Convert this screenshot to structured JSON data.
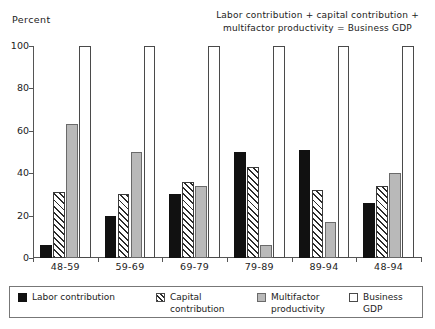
{
  "ylabel": "Percent",
  "annotation": "Labor contribution + capital contribution + multifactor productivity = Business GDP",
  "legend": {
    "items": [
      {
        "name": "labor",
        "label": "Labor contribution",
        "color": "#111111"
      },
      {
        "name": "capital",
        "label": "Capital\ncontribution",
        "color": "#2b2b2b"
      },
      {
        "name": "multifactor",
        "label": "Multifactor\nproductivity",
        "color": "#b9b9b9"
      },
      {
        "name": "gdp",
        "label": "Business GDP",
        "color": "#ffffff"
      }
    ]
  },
  "chart_data": {
    "type": "bar",
    "title": "",
    "subtitle": "",
    "annotation": "Labor contribution + capital contribution + multifactor productivity = Business GDP",
    "xlabel": "",
    "ylabel": "Percent",
    "ylim": [
      0,
      100
    ],
    "yticks": [
      0,
      20,
      40,
      60,
      80,
      100
    ],
    "ytick_labels": [
      "0",
      "20",
      "40",
      "60",
      "80",
      "100"
    ],
    "grid": false,
    "legend_position": "bottom",
    "categories": [
      "48-59",
      "59-69",
      "69-79",
      "79-89",
      "89-94",
      "48-94"
    ],
    "series": [
      {
        "name": "Labor contribution",
        "key": "labor",
        "values": [
          6,
          20,
          30,
          50,
          51,
          26
        ]
      },
      {
        "name": "Capital contribution",
        "key": "capital",
        "values": [
          31,
          30,
          36,
          43,
          32,
          34
        ]
      },
      {
        "name": "Multifactor productivity",
        "key": "multifactor",
        "values": [
          63,
          50,
          34,
          6,
          17,
          40
        ]
      },
      {
        "name": "Business GDP",
        "key": "gdp",
        "values": [
          100,
          100,
          100,
          100,
          100,
          100
        ]
      }
    ]
  }
}
